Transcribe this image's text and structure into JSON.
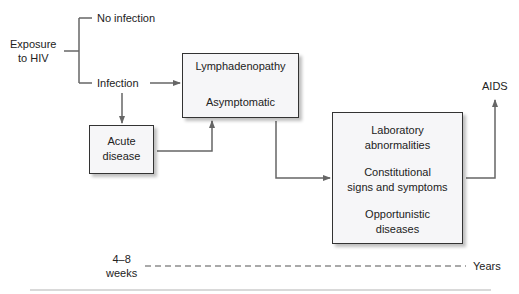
{
  "diagram": {
    "exposure": "Exposure\nto HIV",
    "exposure_l1": "Exposure",
    "exposure_l2": "to HIV",
    "no_infection": "No infection",
    "infection": "Infection",
    "acute_l1": "Acute",
    "acute_l2": "disease",
    "lymph": "Lymphadenopathy",
    "asymptomatic": "Asymptomatic",
    "lab_l1": "Laboratory",
    "lab_l2": "abnormalities",
    "const_l1": "Constitutional",
    "const_l2": "signs and symptoms",
    "opp_l1": "Opportunistic",
    "opp_l2": "diseases",
    "aids": "AIDS",
    "time_start_l1": "4–8",
    "time_start_l2": "weeks",
    "time_end": "Years"
  },
  "colors": {
    "line": "#666666",
    "box_fill": "#f6f6f8",
    "box_border": "#333333"
  }
}
